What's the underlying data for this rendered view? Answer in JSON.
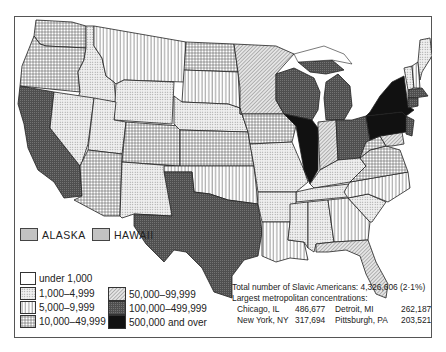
{
  "map": {
    "subject": "Slavic Americans by state",
    "insets": [
      {
        "label": "ALASKA",
        "category": "1,000–4,999"
      },
      {
        "label": "HAWAII",
        "category": "1,000–4,999"
      }
    ],
    "legend": {
      "items": [
        {
          "label": "under 1,000",
          "pattern": "blank"
        },
        {
          "label": "1,000–4,999",
          "pattern": "dots"
        },
        {
          "label": "5,000–9,999",
          "pattern": "vertical-lines"
        },
        {
          "label": "10,000–49,999",
          "pattern": "grid"
        },
        {
          "label": "50,000–99,999",
          "pattern": "diagonal-hatch"
        },
        {
          "label": "100,000–499,999",
          "pattern": "dark-gray"
        },
        {
          "label": "500,000 and over",
          "pattern": "black"
        }
      ]
    },
    "summary": {
      "total": "Total number of Slavic Americans: 4,326,606 (2·1%)",
      "metro_heading": "Largest metropolitan concentrations:",
      "metros": [
        {
          "city": "Chicago, IL",
          "value": "486,677"
        },
        {
          "city": "Detroit, MI",
          "value": "262,187"
        },
        {
          "city": "New York, NY",
          "value": "317,694"
        },
        {
          "city": "Pittsburgh, PA",
          "value": "203,521"
        }
      ]
    },
    "colors": {
      "border": "#222222",
      "dark_gray": "#5a5a5a",
      "black": "#111111",
      "dots_bg": "#ececec"
    }
  }
}
